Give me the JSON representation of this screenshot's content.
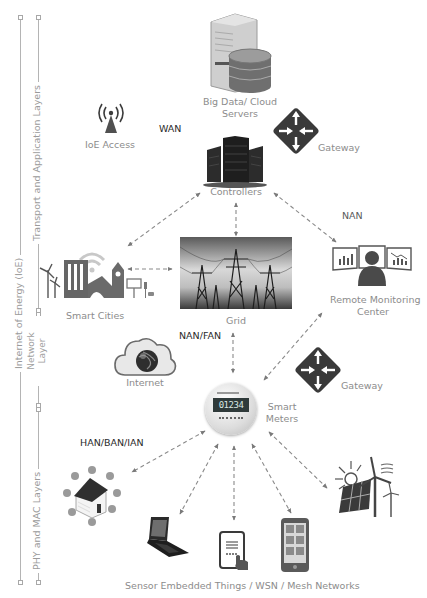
{
  "axis": {
    "outer_label": "Internet of Energy (IoE)",
    "layers": [
      {
        "label": "Transport and Application Layers"
      },
      {
        "label_line1": "Network",
        "label_line2": "Layer"
      },
      {
        "label": "PHY and MAC Layers"
      }
    ]
  },
  "nodes": {
    "cloud": {
      "line1": "Big Data/ Cloud",
      "line2": "Servers",
      "icon": "database-server-icon"
    },
    "ioe_access": {
      "label": "IoE Access",
      "icon": "antenna-icon"
    },
    "gateway_top": {
      "label": "Gateway",
      "icon": "router-icon"
    },
    "controllers": {
      "label": "Controllers",
      "icon": "server-rack-icon"
    },
    "smart_cities": {
      "label": "Smart Cities",
      "icon": "city-icon"
    },
    "grid": {
      "label": "Grid",
      "icon": "power-tower-icon"
    },
    "remote_monitoring": {
      "line1": "Remote Monitoring",
      "line2": "Center",
      "icon": "monitoring-operator-icon"
    },
    "internet": {
      "label": "Internet",
      "icon": "cloud-globe-icon"
    },
    "gateway_bottom": {
      "label": "Gateway",
      "icon": "router-icon"
    },
    "smart_meters": {
      "line1": "Smart",
      "line2": "Meters",
      "icon": "smart-meter-icon",
      "display": "01234"
    },
    "smart_home": {
      "icon": "smart-home-icon"
    },
    "laptop": {
      "icon": "laptop-icon"
    },
    "tablet": {
      "icon": "tablet-icon"
    },
    "phone": {
      "icon": "smartphone-icon"
    },
    "renewables": {
      "icon": "solar-wind-icon"
    },
    "sensors_caption": "Sensor Embedded Things / WSN / Mesh Networks"
  },
  "networks": {
    "wan": "WAN",
    "nan": "NAN",
    "nan_fan": "NAN/FAN",
    "han_ban_ian": "HAN/BAN/IAN"
  },
  "colors": {
    "icon_dark": "#3c3c3c",
    "icon_mid": "#6e6e6e",
    "text_grey": "#8c8c8c",
    "arrow": "#8a8a8a",
    "axis_line": "#b4b4b4"
  }
}
